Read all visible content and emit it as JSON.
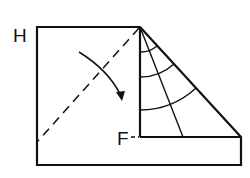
{
  "diagram": {
    "labels": {
      "h": "H",
      "f": "F"
    },
    "colors": {
      "stroke": "#111111",
      "background": "#ffffff"
    }
  }
}
